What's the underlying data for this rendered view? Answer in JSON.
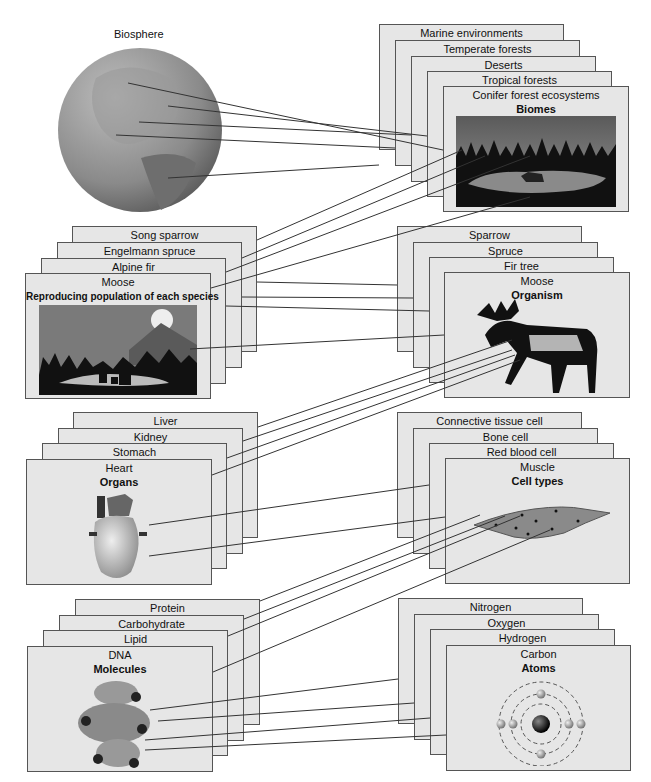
{
  "biosphere": {
    "label": "Biosphere"
  },
  "biomes": {
    "level": "Biomes",
    "cards": [
      "Marine environments",
      "Temperate forests",
      "Deserts",
      "Tropical forests",
      "Conifer forest ecosystems"
    ]
  },
  "populations": {
    "level": "Reproducing population of each species",
    "cards": [
      "Song sparrow",
      "Engelmann spruce",
      "Alpine fir",
      "Moose"
    ]
  },
  "organisms": {
    "level": "Organism",
    "cards": [
      "Sparrow",
      "Spruce",
      "Fir tree",
      "Moose"
    ]
  },
  "organs": {
    "level": "Organs",
    "cards": [
      "Liver",
      "Kidney",
      "Stomach",
      "Heart"
    ]
  },
  "cells": {
    "level": "Cell types",
    "cards": [
      "Connective tissue cell",
      "Bone cell",
      "Red blood cell",
      "Muscle"
    ]
  },
  "molecules": {
    "level": "Molecules",
    "cards": [
      "Protein",
      "Carbohydrate",
      "Lipid",
      "DNA"
    ]
  },
  "atoms": {
    "level": "Atoms",
    "cards": [
      "Nitrogen",
      "Oxygen",
      "Hydrogen",
      "Carbon"
    ]
  }
}
